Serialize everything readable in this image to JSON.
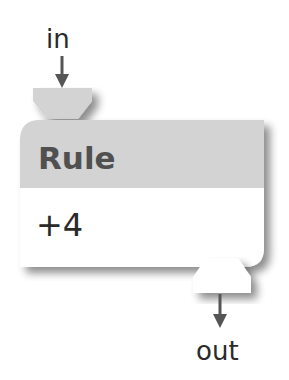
{
  "node": {
    "title": "Rule",
    "value": "+4"
  },
  "ports": {
    "input_label": "in",
    "output_label": "out"
  },
  "colors": {
    "header_fill": "#d3d3d3",
    "body_fill": "#ffffff",
    "title_text": "#505050",
    "arrow": "#555555",
    "label_text": "#2a2a2a"
  }
}
